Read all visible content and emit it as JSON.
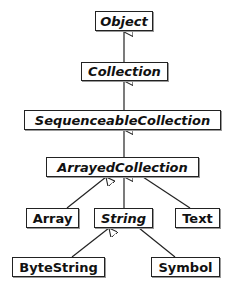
{
  "diagram": {
    "type": "class-hierarchy",
    "nodes": {
      "object": {
        "label": "Object",
        "abstract": true
      },
      "collection": {
        "label": "Collection",
        "abstract": true
      },
      "sequenceable": {
        "label": "SequenceableCollection",
        "abstract": true
      },
      "arrayed": {
        "label": "ArrayedCollection",
        "abstract": true
      },
      "array": {
        "label": "Array",
        "abstract": false
      },
      "string": {
        "label": "String",
        "abstract": true
      },
      "text": {
        "label": "Text",
        "abstract": false
      },
      "bytestring": {
        "label": "ByteString",
        "abstract": false
      },
      "symbol": {
        "label": "Symbol",
        "abstract": false
      }
    },
    "edges": [
      {
        "from": "Collection",
        "to": "Object"
      },
      {
        "from": "SequenceableCollection",
        "to": "Collection"
      },
      {
        "from": "ArrayedCollection",
        "to": "SequenceableCollection"
      },
      {
        "from": "Array",
        "to": "ArrayedCollection"
      },
      {
        "from": "String",
        "to": "ArrayedCollection"
      },
      {
        "from": "Text",
        "to": "ArrayedCollection"
      },
      {
        "from": "ByteString",
        "to": "String"
      },
      {
        "from": "Symbol",
        "to": "String"
      }
    ],
    "edge_style": "inheritance-hollow-triangle"
  }
}
